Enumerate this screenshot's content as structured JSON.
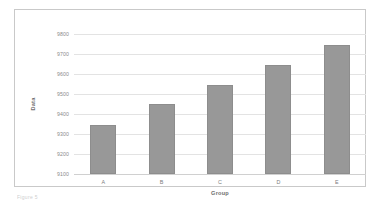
{
  "chart_data": {
    "type": "bar",
    "title": "",
    "xlabel": "Group",
    "ylabel": "Data",
    "categories": [
      "A",
      "B",
      "C",
      "D",
      "E"
    ],
    "values": [
      9345,
      9450,
      9545,
      9645,
      9745
    ],
    "ylim": [
      9100,
      9800
    ],
    "yticks": [
      9100,
      9200,
      9300,
      9400,
      9500,
      9600,
      9700,
      9800
    ],
    "ytick_labels": [
      "9100",
      "9200",
      "9300",
      "9400",
      "9500",
      "9600",
      "9700",
      "9800"
    ],
    "grid": true,
    "legend": false,
    "bar_color": "#989898",
    "bar_edge_color": "#8d8d8d",
    "grid_color": "#e3e3e3",
    "frame_color": "#c9c9c9",
    "tick_label_color": "#8a8a8a",
    "axis_title_color": "#6e6e6e",
    "background": "#ffffff"
  },
  "caption": {
    "text": "Figure 5"
  }
}
